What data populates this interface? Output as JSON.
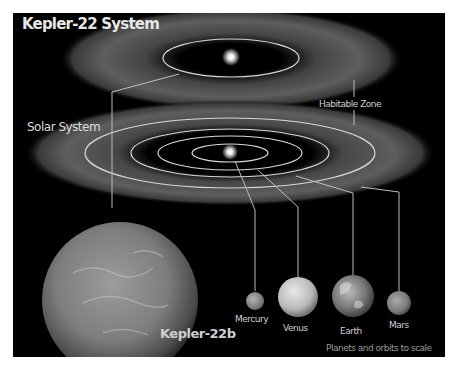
{
  "titles": {
    "kepler_system": "Kepler-22 System",
    "solar_system": "Solar System"
  },
  "labels": {
    "habitable_zone": "Habitable Zone",
    "kepler_22b": "Kepler-22b",
    "scale_note": "Planets and orbits to scale"
  },
  "planets": [
    {
      "name": "Mercury"
    },
    {
      "name": "Venus"
    },
    {
      "name": "Earth"
    },
    {
      "name": "Mars"
    }
  ],
  "colors": {
    "background": "#000000",
    "habitable_zone": "#6a6a6a",
    "orbit_line": "#d8d8d8",
    "star": "#ffffff"
  }
}
